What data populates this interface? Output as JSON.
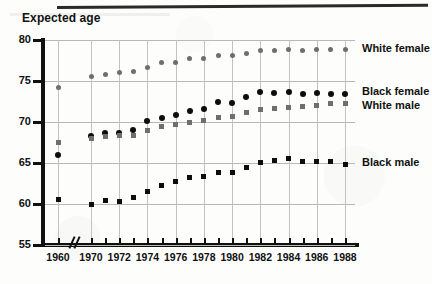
{
  "chart_data": {
    "type": "scatter",
    "title": "Expected age",
    "xlabel": "",
    "ylabel": "Expected age",
    "ylim": [
      55,
      80
    ],
    "yticks": [
      55,
      60,
      65,
      70,
      75,
      80
    ],
    "xlim": [
      1959,
      1989
    ],
    "xticks": [
      1960,
      1970,
      1971,
      1972,
      1973,
      1974,
      1975,
      1976,
      1977,
      1978,
      1979,
      1980,
      1981,
      1982,
      1983,
      1984,
      1985,
      1986,
      1987,
      1988
    ],
    "xtick_labels": [
      "1960",
      "1970",
      "1972",
      "1974",
      "1976",
      "1978",
      "1980",
      "1982",
      "1984",
      "1986",
      "1988"
    ],
    "axis_break": {
      "between": [
        1960,
        1970
      ],
      "symbol": "//"
    },
    "grid": "both",
    "legend_position": "right-inline",
    "series": [
      {
        "name": "White female",
        "marker": "circle",
        "color": "#6e6e6e",
        "x": [
          1960,
          1970,
          1971,
          1972,
          1973,
          1974,
          1975,
          1976,
          1977,
          1978,
          1979,
          1980,
          1981,
          1982,
          1983,
          1984,
          1985,
          1986,
          1987,
          1988
        ],
        "values": [
          74.2,
          75.6,
          75.8,
          76.0,
          76.1,
          76.7,
          77.2,
          77.3,
          77.7,
          77.8,
          78.1,
          78.1,
          78.4,
          78.7,
          78.7,
          78.8,
          78.7,
          78.8,
          78.9,
          78.9
        ]
      },
      {
        "name": "Black female",
        "marker": "circle",
        "color": "#0d0d0d",
        "x": [
          1960,
          1970,
          1971,
          1972,
          1973,
          1974,
          1975,
          1976,
          1977,
          1978,
          1979,
          1980,
          1981,
          1982,
          1983,
          1984,
          1985,
          1986,
          1987,
          1988
        ],
        "values": [
          66.0,
          68.3,
          68.6,
          68.7,
          69.0,
          70.1,
          70.5,
          70.9,
          71.4,
          71.6,
          72.4,
          72.3,
          73.0,
          73.6,
          73.5,
          73.6,
          73.4,
          73.5,
          73.4,
          73.4
        ]
      },
      {
        "name": "White male",
        "marker": "square",
        "color": "#6e6e6e",
        "x": [
          1960,
          1970,
          1971,
          1972,
          1973,
          1974,
          1975,
          1976,
          1977,
          1978,
          1979,
          1980,
          1981,
          1982,
          1983,
          1984,
          1985,
          1986,
          1987,
          1988
        ],
        "values": [
          67.5,
          68.0,
          68.2,
          68.3,
          68.4,
          69.0,
          69.5,
          69.7,
          70.0,
          70.2,
          70.6,
          70.7,
          71.1,
          71.5,
          71.7,
          71.8,
          71.9,
          72.0,
          72.2,
          72.3
        ]
      },
      {
        "name": "Black male",
        "marker": "square",
        "color": "#0d0d0d",
        "x": [
          1960,
          1970,
          1971,
          1972,
          1973,
          1974,
          1975,
          1976,
          1977,
          1978,
          1979,
          1980,
          1981,
          1982,
          1983,
          1984,
          1985,
          1986,
          1987,
          1988
        ],
        "values": [
          60.6,
          59.9,
          60.4,
          60.3,
          60.8,
          61.5,
          62.2,
          62.8,
          63.2,
          63.4,
          63.9,
          63.8,
          64.5,
          65.1,
          65.3,
          65.5,
          65.2,
          65.2,
          65.2,
          64.8
        ]
      }
    ],
    "legend": [
      {
        "label": "White female",
        "y_value": 78.9
      },
      {
        "label": "Black female",
        "y_value": 73.6
      },
      {
        "label": "White male",
        "y_value": 72.0
      },
      {
        "label": "Black male",
        "y_value": 65.0
      }
    ]
  }
}
